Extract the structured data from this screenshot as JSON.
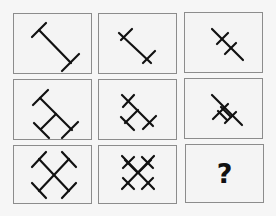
{
  "puzzle": {
    "type": "3x3 figure matrix",
    "question_mark": "?",
    "cells": [
      {
        "row": 1,
        "col": 1,
        "figure": "diagonal-line-with-end-crossbars",
        "description": "long diagonal bar with perpendicular caps at both ends"
      },
      {
        "row": 1,
        "col": 2,
        "figure": "diagonal-line-with-end-crosses",
        "description": "shorter diagonal bar with crosses at both ends"
      },
      {
        "row": 1,
        "col": 3,
        "figure": "diagonal-line-with-inner-crosses",
        "description": "diagonal bar with two crossbars near the center"
      },
      {
        "row": 2,
        "col": 1,
        "figure": "rotated-h-shape",
        "description": "two diagonal I-bars joined, capped ends"
      },
      {
        "row": 2,
        "col": 2,
        "figure": "rotated-h-with-crosses",
        "description": "joined diagonal bars with crosses at ends"
      },
      {
        "row": 2,
        "col": 3,
        "figure": "compact-crossed-lines",
        "description": "compact diagonal bars with crossbars forming small loop"
      },
      {
        "row": 3,
        "col": 1,
        "figure": "square-cross-with-caps",
        "description": "X of two diagonals with perpendicular caps on all four ends"
      },
      {
        "row": 3,
        "col": 2,
        "figure": "lattice-crosses",
        "description": "X with crossing bars at all four arms forming lattice"
      },
      {
        "row": 3,
        "col": 3,
        "figure": "unknown",
        "label": "?"
      }
    ]
  },
  "colors": {
    "background": "#f6f6f6",
    "cell_border": "#8c8c8c",
    "stroke": "#111111"
  }
}
